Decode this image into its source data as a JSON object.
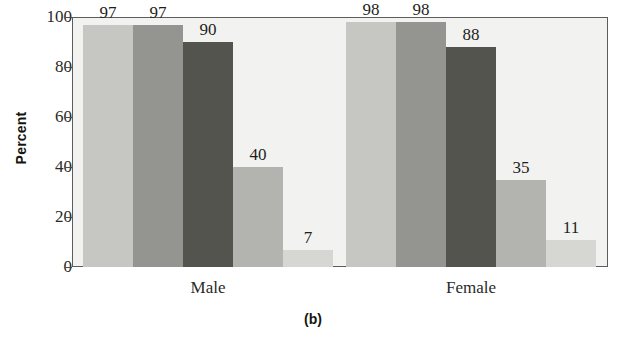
{
  "chart_data": {
    "type": "bar",
    "title": "",
    "subtitle": "",
    "caption": "(b)",
    "xlabel": "",
    "ylabel": "Percent",
    "ylim": [
      0,
      100
    ],
    "yticks": [
      0,
      20,
      40,
      60,
      80,
      100
    ],
    "ytick_labels": [
      "0",
      "20",
      "40",
      "60",
      "80",
      "100"
    ],
    "grid": false,
    "legend": "none",
    "categories": [
      "Male",
      "Female"
    ],
    "series": [
      {
        "name": "Series 1",
        "values": [
          97,
          98
        ],
        "color": "#c6c6c3"
      },
      {
        "name": "Series 2",
        "values": [
          97,
          98
        ],
        "color": "#949491"
      },
      {
        "name": "Series 3",
        "values": [
          90,
          88
        ],
        "color": "#54544f"
      },
      {
        "name": "Series 4",
        "values": [
          40,
          35
        ],
        "color": "#b3b3b0"
      },
      {
        "name": "Series 5",
        "values": [
          7,
          11
        ],
        "color": "#d6d6d3"
      }
    ],
    "bars": [
      {
        "group": "Male",
        "series": "Series 1",
        "value": 97,
        "label": "97",
        "color": "#c6c6c3"
      },
      {
        "group": "Male",
        "series": "Series 2",
        "value": 97,
        "label": "97",
        "color": "#949491"
      },
      {
        "group": "Male",
        "series": "Series 3",
        "value": 90,
        "label": "90",
        "color": "#54544f"
      },
      {
        "group": "Male",
        "series": "Series 4",
        "value": 40,
        "label": "40",
        "color": "#b3b3b0"
      },
      {
        "group": "Male",
        "series": "Series 5",
        "value": 7,
        "label": "7",
        "color": "#d6d6d3"
      },
      {
        "group": "Female",
        "series": "Series 1",
        "value": 98,
        "label": "98",
        "color": "#c6c6c3"
      },
      {
        "group": "Female",
        "series": "Series 2",
        "value": 98,
        "label": "98",
        "color": "#949491"
      },
      {
        "group": "Female",
        "series": "Series 3",
        "value": 88,
        "label": "88",
        "color": "#54544f"
      },
      {
        "group": "Female",
        "series": "Series 4",
        "value": 35,
        "label": "35",
        "color": "#b3b3b0"
      },
      {
        "group": "Female",
        "series": "Series 5",
        "value": 11,
        "label": "11",
        "color": "#d6d6d3"
      }
    ],
    "plot_background": "#f2f2f0",
    "frame_color": "#5d5d59",
    "text_color": "#1e1e1a"
  }
}
